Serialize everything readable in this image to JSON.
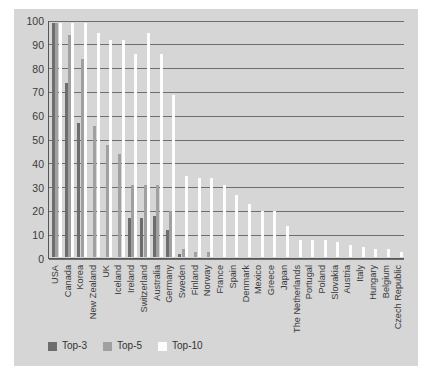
{
  "chart_data": {
    "type": "bar",
    "title": "",
    "subtitle": "",
    "xlabel": "",
    "ylabel": "",
    "ylim": [
      0,
      100
    ],
    "yticks": [
      0,
      10,
      20,
      30,
      40,
      50,
      60,
      70,
      80,
      90,
      100
    ],
    "grid": true,
    "legend_position": "bottom-left",
    "categories": [
      "USA",
      "Canada",
      "Korea",
      "New Zealand",
      "UK",
      "Iceland",
      "Ireland",
      "Switzerland",
      "Australia",
      "Germany",
      "Sweden",
      "Finland",
      "Norway",
      "France",
      "Spain",
      "Denmark",
      "Mexico",
      "Greece",
      "Japan",
      "The Netherlands",
      "Portugal",
      "Poland",
      "Slovakia",
      "Austria",
      "Italy",
      "Hungary",
      "Belgium",
      "Czech Republic"
    ],
    "series": [
      {
        "name": "Top-3",
        "color": "#6d6d6d",
        "values": [
          98,
          73,
          56,
          0,
          0,
          0,
          16,
          16,
          17,
          11,
          1,
          0,
          0,
          0,
          0,
          0,
          0,
          0,
          0,
          0,
          0,
          0,
          0,
          0,
          0,
          0,
          0,
          0
        ]
      },
      {
        "name": "Top-5",
        "color": "#a0a0a0",
        "values": [
          98,
          93,
          83,
          55,
          47,
          43,
          30,
          30,
          30,
          19,
          3,
          2,
          2,
          0,
          0,
          0,
          0,
          0,
          0,
          0,
          0,
          0,
          0,
          0,
          0,
          0,
          0,
          0
        ]
      },
      {
        "name": "Top-10",
        "color": "#fdfdfd",
        "values": [
          98,
          98,
          98,
          94,
          91,
          91,
          85,
          94,
          85,
          68,
          34,
          33,
          33,
          30,
          26,
          22,
          19,
          19,
          13,
          7,
          7,
          7,
          6,
          5,
          4,
          3,
          3,
          2
        ]
      }
    ]
  },
  "legend": {
    "items": [
      {
        "label": "Top-3",
        "key": "top3"
      },
      {
        "label": "Top-5",
        "key": "top5"
      },
      {
        "label": "Top-10",
        "key": "top10"
      }
    ]
  }
}
